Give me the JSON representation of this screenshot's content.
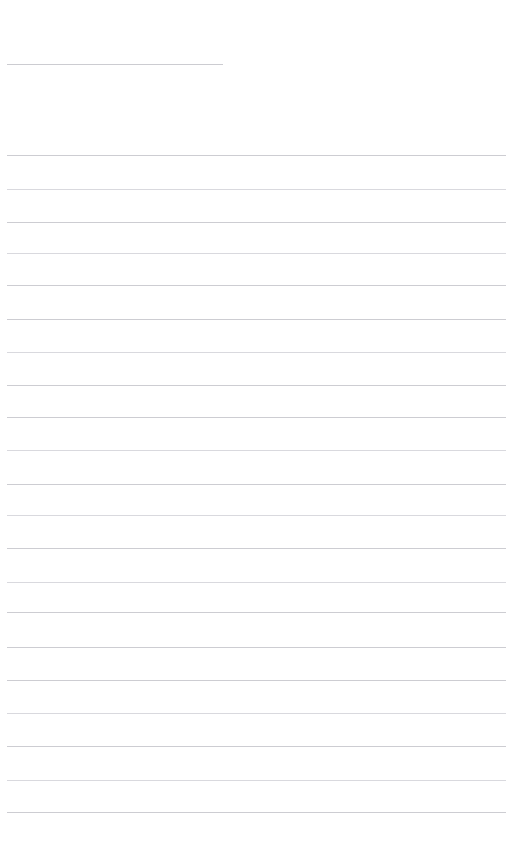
{
  "page": {
    "kind": "lined-note-page",
    "background_color": "#ffffff",
    "width": 529,
    "height": 860,
    "is_blank": true,
    "visible_text": ""
  },
  "header_rule": {
    "name": "header-rule",
    "x": 7,
    "y": 64,
    "width": 216,
    "color": "#c9c9cf",
    "thickness": 1
  },
  "rule_style": {
    "left": 7,
    "right_end": 506,
    "color": "#cdcdd2",
    "soft_color": "#d9d9de",
    "thickness": 1,
    "spacing": 34.6
  },
  "rule_lines": [
    {
      "index": 1,
      "y": 155,
      "width": 499,
      "soft": false
    },
    {
      "index": 2,
      "y": 189,
      "width": 499,
      "soft": true
    },
    {
      "index": 3,
      "y": 222,
      "width": 499,
      "soft": false
    },
    {
      "index": 4,
      "y": 253,
      "width": 499,
      "soft": true
    },
    {
      "index": 5,
      "y": 285,
      "width": 499,
      "soft": false
    },
    {
      "index": 6,
      "y": 319,
      "width": 499,
      "soft": false
    },
    {
      "index": 7,
      "y": 352,
      "width": 499,
      "soft": true
    },
    {
      "index": 8,
      "y": 385,
      "width": 499,
      "soft": false
    },
    {
      "index": 9,
      "y": 417,
      "width": 499,
      "soft": false
    },
    {
      "index": 10,
      "y": 450,
      "width": 499,
      "soft": true
    },
    {
      "index": 11,
      "y": 484,
      "width": 499,
      "soft": false
    },
    {
      "index": 12,
      "y": 515,
      "width": 499,
      "soft": true
    },
    {
      "index": 13,
      "y": 548,
      "width": 499,
      "soft": false
    },
    {
      "index": 14,
      "y": 582,
      "width": 499,
      "soft": true
    },
    {
      "index": 15,
      "y": 612,
      "width": 499,
      "soft": false
    },
    {
      "index": 16,
      "y": 647,
      "width": 499,
      "soft": false
    },
    {
      "index": 17,
      "y": 680,
      "width": 499,
      "soft": false
    },
    {
      "index": 18,
      "y": 713,
      "width": 499,
      "soft": true
    },
    {
      "index": 19,
      "y": 746,
      "width": 499,
      "soft": false
    },
    {
      "index": 20,
      "y": 780,
      "width": 499,
      "soft": true
    },
    {
      "index": 21,
      "y": 812,
      "width": 499,
      "soft": false
    }
  ]
}
